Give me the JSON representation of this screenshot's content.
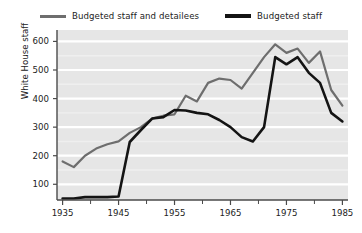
{
  "legend": {
    "entries": [
      {
        "label": "Budgeted staff and detailees",
        "color": "#6e6e6e",
        "name": "budgeted-staff-and-detailees"
      },
      {
        "label": "Budgeted staff",
        "color": "#141414",
        "name": "budgeted-staff"
      }
    ]
  },
  "axes": {
    "ylabel": "White House staff",
    "xlabel": "",
    "yticks": [
      100,
      200,
      300,
      400,
      500,
      600
    ],
    "ytick_labels": [
      "100",
      "200",
      "300",
      "400",
      "500",
      "600"
    ],
    "xticks": [
      1935,
      1945,
      1955,
      1965,
      1975,
      1985
    ],
    "xtick_labels": [
      "1935",
      "1945",
      "1955",
      "1965",
      "1975",
      "1985"
    ],
    "xminor_ticks": [
      1940,
      1950,
      1960,
      1970,
      1980
    ],
    "xlim": [
      1934,
      1986
    ],
    "ylim": [
      45,
      640
    ],
    "grid": "horizontal-white"
  },
  "style": {
    "plot_background": "#e6e6e6",
    "gridline_color": "#ffffff",
    "axis_color": "#4a4a4a",
    "page_background": "#ffffff"
  },
  "chart_data": {
    "type": "line",
    "title": "",
    "xlabel": "",
    "ylabel": "White House staff",
    "xlim": [
      1934,
      1986
    ],
    "ylim": [
      45,
      640
    ],
    "grid": true,
    "legend_position": "top-center",
    "x": [
      1935,
      1937,
      1939,
      1941,
      1943,
      1945,
      1947,
      1949,
      1951,
      1953,
      1955,
      1957,
      1959,
      1961,
      1963,
      1965,
      1967,
      1969,
      1971,
      1973,
      1975,
      1977,
      1979,
      1981,
      1983,
      1985
    ],
    "series": [
      {
        "name": "Budgeted staff and detailees",
        "color": "#6e6e6e",
        "values": [
          180,
          160,
          200,
          225,
          240,
          250,
          280,
          300,
          330,
          340,
          345,
          410,
          390,
          455,
          470,
          465,
          435,
          490,
          545,
          590,
          560,
          575,
          525,
          565,
          430,
          375
        ]
      },
      {
        "name": "Budgeted staff",
        "color": "#141414",
        "values": [
          50,
          50,
          55,
          55,
          55,
          57,
          248,
          290,
          330,
          335,
          360,
          358,
          350,
          345,
          325,
          300,
          265,
          250,
          300,
          545,
          520,
          545,
          490,
          455,
          350,
          320
        ]
      }
    ]
  }
}
